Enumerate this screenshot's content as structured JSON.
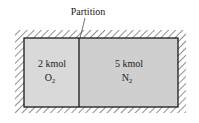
{
  "diagram": {
    "partition_label": "Partition",
    "left_chamber": {
      "amount": "2 kmol",
      "species_symbol": "O",
      "species_subscript": "2",
      "fill": "#d9d9d9"
    },
    "right_chamber": {
      "amount": "5 kmol",
      "species_symbol": "N",
      "species_subscript": "2",
      "fill": "#cfcfcf"
    },
    "colors": {
      "border": "#1a1a1a",
      "hatch": "#333333",
      "text": "#222222"
    }
  }
}
